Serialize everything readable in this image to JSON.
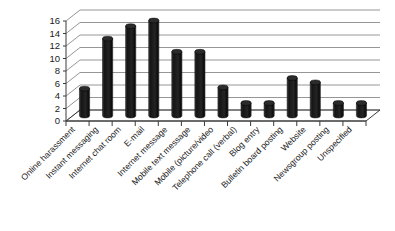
{
  "chart_data": {
    "type": "bar",
    "title": "",
    "subtitle": "",
    "xlabel": "",
    "ylabel": "",
    "ylim": [
      0,
      16
    ],
    "ytick_step": 2,
    "yticks": [
      "0",
      "2",
      "4",
      "6",
      "8",
      "10",
      "12",
      "14",
      "16"
    ],
    "grid": true,
    "legend": false,
    "style": "3d-cylinder",
    "bar_color": "#1c1c1c",
    "categories": [
      "Online harassment",
      "Instant messaging",
      "Internet chat room",
      "E-mail",
      "Internet message",
      "Mobile text message",
      "Mobile (picture/video",
      "Telephone call (verbal)",
      "Blog entry",
      "Bulletin board posting",
      "Website",
      "Newsgroup posting",
      "Unspecified"
    ],
    "values": [
      4.3,
      12.3,
      14.3,
      15.2,
      10.2,
      10.2,
      4.5,
      2,
      2,
      6,
      5.3,
      2,
      2
    ]
  },
  "chart": {
    "background_color": "#ffffff",
    "axis_color": "#3a3a3a",
    "grid_color": "#8a8a8a"
  }
}
